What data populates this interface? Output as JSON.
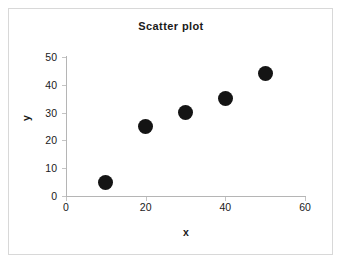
{
  "chart_data": {
    "type": "scatter",
    "title": "Scatter plot",
    "xlabel": "x",
    "ylabel": "y",
    "xlim": [
      0,
      60
    ],
    "ylim": [
      0,
      50
    ],
    "xticks": [
      0,
      20,
      40,
      60
    ],
    "yticks": [
      0,
      10,
      20,
      30,
      40,
      50
    ],
    "xtick_labels": [
      "0",
      "20",
      "40",
      "60"
    ],
    "ytick_labels": [
      "0",
      "10",
      "20",
      "30",
      "40",
      "50"
    ],
    "grid": false,
    "legend": false,
    "marker": {
      "shape": "circle",
      "color": "#141414",
      "size_px": 15
    },
    "series": [
      {
        "name": "series-1",
        "points": [
          {
            "x": 10,
            "y": 5
          },
          {
            "x": 20,
            "y": 25
          },
          {
            "x": 30,
            "y": 30
          },
          {
            "x": 40,
            "y": 35
          },
          {
            "x": 50,
            "y": 44
          }
        ]
      }
    ]
  },
  "colors": {
    "marker": "#141414",
    "axis": "#b5b5b5",
    "frame": "#d8d8d8",
    "text": "#1a1a1a",
    "background": "#ffffff"
  }
}
